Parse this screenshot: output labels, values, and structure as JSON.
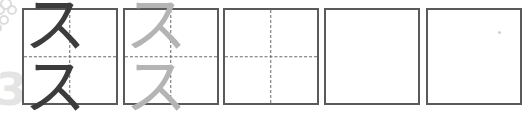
{
  "worksheet": {
    "character": "スス",
    "boxes": [
      {
        "index": 1,
        "content": "スス",
        "style": "dark",
        "guides": true
      },
      {
        "index": 2,
        "content": "スス",
        "style": "light",
        "guides": true
      },
      {
        "index": 3,
        "content": "",
        "style": "empty",
        "guides": true
      },
      {
        "index": 4,
        "content": "",
        "style": "empty",
        "guides": false
      },
      {
        "index": 5,
        "content": "",
        "style": "empty",
        "guides": false
      }
    ],
    "decoration_number": "3"
  },
  "colors": {
    "border": "#5a5a5a",
    "guide": "#6a6a6a",
    "model_glyph": "#3c3c3c",
    "trace_glyph": "#b4b4b4",
    "decoration": "#e4e4e4"
  }
}
